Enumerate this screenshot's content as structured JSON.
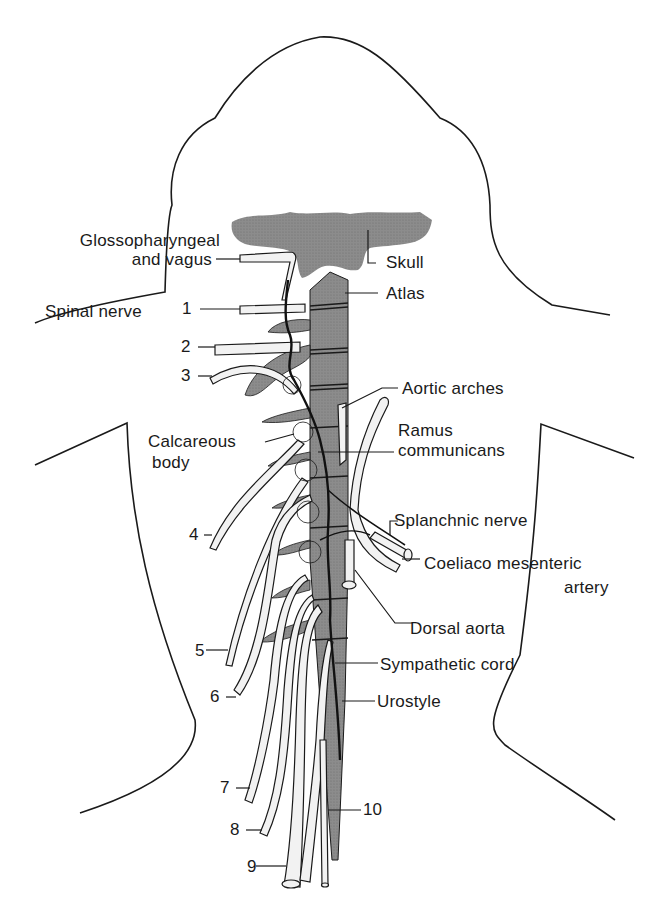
{
  "figure": {
    "colors": {
      "ink": "#1a1a1a",
      "bone_fill": "#8c8c8c",
      "nerve_fill": "#f2f2f2",
      "background": "#ffffff"
    }
  },
  "labels": {
    "glossopharyngeal_line1": "Glossopharyngeal",
    "glossopharyngeal_line2": "and vagus",
    "spinal_nerve": "Spinal nerve",
    "skull": "Skull",
    "atlas": "Atlas",
    "aortic_arches": "Aortic arches",
    "ramus_line1": "Ramus",
    "ramus_line2": "communicans",
    "calcareous_line1": "Calcareous",
    "calcareous_line2": "body",
    "splanchnic_nerve": "Splanchnic nerve",
    "coeliaco_line1": "Coeliaco mesenteric",
    "coeliaco_line2": "artery",
    "dorsal_aorta": "Dorsal aorta",
    "sympathetic_cord": "Sympathetic cord",
    "urostyle": "Urostyle"
  },
  "nerve_numbers": [
    "1",
    "2",
    "3",
    "4",
    "5",
    "6",
    "7",
    "8",
    "9",
    "10"
  ]
}
